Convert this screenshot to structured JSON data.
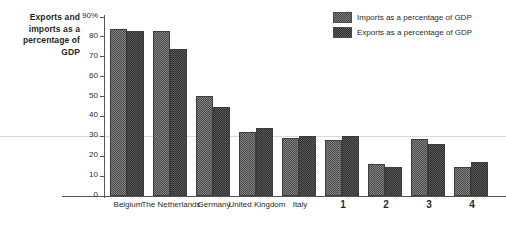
{
  "chart_data": {
    "type": "bar",
    "title": "",
    "ylabel": "Exports and imports as a percentage of GDP",
    "xlabel": "",
    "ylim": [
      0,
      90
    ],
    "ytick_labels": [
      "90%",
      "80",
      "70",
      "60",
      "50",
      "40",
      "30",
      "20",
      "10",
      "0"
    ],
    "ytick_values": [
      90,
      80,
      70,
      60,
      50,
      40,
      30,
      20,
      10,
      0
    ],
    "grid": false,
    "legend_position": "top-right",
    "categories": [
      "Belgium",
      "The Netherlands",
      "Germany",
      "United Kingdom",
      "Italy",
      "1",
      "2",
      "3",
      "4"
    ],
    "series": [
      {
        "name": "Imports as a percentage of GDP",
        "values": [
          84,
          83,
          50.5,
          32,
          29,
          28,
          16,
          28.5,
          14.5
        ]
      },
      {
        "name": "Exports as a percentage of GDP",
        "values": [
          83,
          74,
          45,
          34,
          30,
          30,
          14.5,
          26,
          17
        ]
      }
    ]
  },
  "legend": {
    "items": [
      {
        "label": "Imports as a percentage of GDP",
        "swatch": "imports-swatch"
      },
      {
        "label": "Exports as a percentage of GDP",
        "swatch": "exports-swatch"
      }
    ]
  },
  "axis_title": {
    "line1": "Exports and",
    "line2": "imports as a",
    "line3": "percentage of",
    "line4": "GDP"
  }
}
